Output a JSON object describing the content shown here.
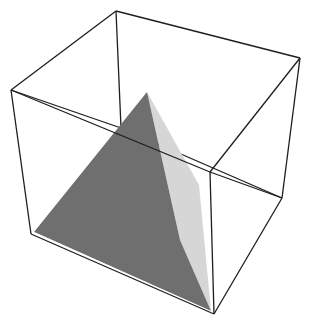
{
  "diagram": {
    "title": "",
    "colors": {
      "background": "#ffffff",
      "edge": "#1e1e1e",
      "dark_face": "#6f6f6f",
      "light_face": "#d6d6d6",
      "base_sliver": "#ffffff"
    },
    "cube": {
      "vertices": {
        "top_back_left": [
          116,
          11
        ],
        "top_back_right": [
          300,
          58
        ],
        "top_front_left": [
          11,
          90
        ],
        "top_front_right": [
          210,
          172
        ],
        "bottom_back_left": [
          121,
          128
        ],
        "bottom_back_right": [
          282,
          198
        ],
        "bottom_front_left": [
          31,
          234
        ],
        "bottom_front_right": [
          214,
          314
        ]
      }
    },
    "pyramid": {
      "apex": [
        147,
        92
      ],
      "base_left": [
        34,
        232
      ],
      "base_right": [
        211,
        311
      ],
      "light_face_edge": [
        199,
        185
      ],
      "dark_light_boundary": [
        180,
        240
      ]
    }
  }
}
